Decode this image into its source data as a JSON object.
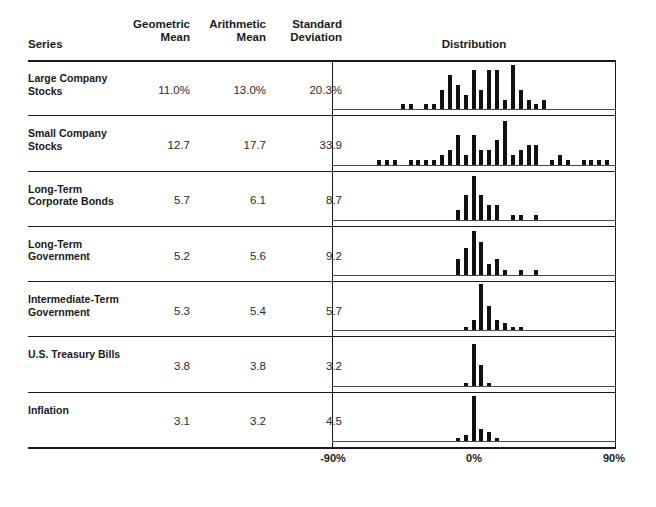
{
  "header": {
    "series_label": "Series",
    "col_geometric": "Geometric\nMean",
    "col_geometric_line1": "Geometric",
    "col_geometric_line2": "Mean",
    "col_arithmetic_line1": "Arithmetic",
    "col_arithmetic_line2": "Mean",
    "col_stddev_line1": "Standard",
    "col_stddev_line2": "Deviation",
    "col_distribution": "Distribution"
  },
  "axis": {
    "left": "-90%",
    "center": "0%",
    "right": "90%"
  },
  "rows": [
    {
      "label": "Large Company\nStocks",
      "geometric_mean": "11.0%",
      "arithmetic_mean": "13.0%",
      "standard_deviation": "20.3%"
    },
    {
      "label": "Small Company\nStocks",
      "geometric_mean": "12.7",
      "arithmetic_mean": "17.7",
      "standard_deviation": "33.9"
    },
    {
      "label": "Long-Term\nCorporate Bonds",
      "geometric_mean": "5.7",
      "arithmetic_mean": "6.1",
      "standard_deviation": "8.7"
    },
    {
      "label": "Long-Term\nGovernment",
      "geometric_mean": "5.2",
      "arithmetic_mean": "5.6",
      "standard_deviation": "9.2"
    },
    {
      "label": "Intermediate-Term\nGovernment",
      "geometric_mean": "5.3",
      "arithmetic_mean": "5.4",
      "standard_deviation": "5.7"
    },
    {
      "label": "U.S. Treasury Bills",
      "geometric_mean": "3.8",
      "arithmetic_mean": "3.8",
      "standard_deviation": "3.2"
    },
    {
      "label": "Inflation",
      "geometric_mean": "3.1",
      "arithmetic_mean": "3.2",
      "standard_deviation": "4.5"
    }
  ],
  "chart_data": {
    "type": "bar",
    "title": "Distribution",
    "subtitle": "Histograms of annual total returns, each row a separate asset class",
    "xlabel": "Annual return (%)",
    "ylabel": "Frequency (count of years)",
    "xlim": [
      -90,
      90
    ],
    "xticks": [
      -90,
      0,
      90
    ],
    "xticklabels": [
      "-90%",
      "0%",
      "90%"
    ],
    "grid": false,
    "legend": false,
    "bin_width": 5,
    "note": "Each bar is a 5% wide return bin; bar height is the number of years falling in that bin.",
    "series": [
      {
        "name": "Large Company Stocks",
        "bins": [
          -45,
          -40,
          -30,
          -25,
          -20,
          -15,
          -10,
          -5,
          0,
          5,
          10,
          15,
          20,
          25,
          30,
          35,
          40,
          45,
          50
        ],
        "values": [
          1,
          1,
          1,
          1,
          4,
          7,
          5,
          3,
          8,
          4,
          8,
          8,
          2,
          9,
          4,
          2,
          1,
          2,
          0
        ]
      },
      {
        "name": "Small Company Stocks",
        "bins": [
          -60,
          -55,
          -50,
          -45,
          -40,
          -35,
          -30,
          -25,
          -20,
          -15,
          -10,
          -5,
          0,
          5,
          10,
          15,
          20,
          25,
          30,
          35,
          40,
          45,
          50,
          55,
          60,
          65,
          70,
          75,
          80,
          85
        ],
        "values": [
          1,
          1,
          1,
          0,
          1,
          1,
          1,
          1,
          2,
          3,
          6,
          2,
          6,
          3,
          3,
          5,
          9,
          2,
          3,
          4,
          4,
          0,
          1,
          2,
          1,
          0,
          1,
          1,
          1,
          1
        ]
      },
      {
        "name": "Long-Term Corporate Bonds",
        "bins": [
          -10,
          -5,
          0,
          5,
          10,
          15,
          20,
          25,
          30,
          35,
          40
        ],
        "values": [
          2,
          5,
          9,
          5,
          3,
          3,
          0,
          1,
          1,
          0,
          1
        ]
      },
      {
        "name": "Long-Term Government",
        "bins": [
          -10,
          -5,
          0,
          5,
          10,
          15,
          20,
          25,
          30,
          35,
          40
        ],
        "values": [
          3,
          5,
          8,
          6,
          2,
          3,
          1,
          0,
          1,
          0,
          1
        ]
      },
      {
        "name": "Intermediate-Term Government",
        "bins": [
          -5,
          0,
          5,
          10,
          15,
          20,
          25,
          30
        ],
        "values": [
          1,
          3,
          13,
          7,
          3,
          2,
          1,
          1
        ]
      },
      {
        "name": "U.S. Treasury Bills",
        "bins": [
          -5,
          0,
          5,
          10,
          15
        ],
        "values": [
          1,
          14,
          7,
          1,
          0
        ]
      },
      {
        "name": "Inflation",
        "bins": [
          -10,
          -5,
          0,
          5,
          10,
          15,
          20
        ],
        "values": [
          1,
          2,
          15,
          4,
          3,
          1,
          0
        ]
      }
    ]
  }
}
